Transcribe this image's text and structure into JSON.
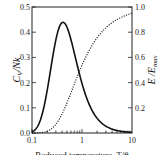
{
  "chart_data": {
    "type": "line",
    "title": "",
    "xlabel": "Reduced temperature, T/θ",
    "ylabel": "C_V / Nk",
    "ylabel_right": "E / E_max",
    "xscale": "log",
    "xlim": [
      0.1,
      10
    ],
    "ylim": [
      0,
      0.5
    ],
    "ylim_right": [
      0,
      1.0
    ],
    "x_ticks": [
      "0.1",
      "1",
      "10"
    ],
    "y_ticks": [
      "0.0",
      "0.1",
      "0.2",
      "0.3",
      "0.4",
      "0.5"
    ],
    "y_ticks_right": [
      "0.2",
      "0.4",
      "0.6",
      "0.8",
      "1.0"
    ],
    "grid": false,
    "legend": null,
    "x": [
      0.1,
      0.15,
      0.2,
      0.25,
      0.3,
      0.4,
      0.5,
      0.6,
      0.8,
      1,
      1.5,
      2,
      3,
      5,
      10
    ],
    "series": [
      {
        "name": "C_V/Nk",
        "axis": "left",
        "style": "solid",
        "values": [
          0.005,
          0.056,
          0.166,
          0.283,
          0.37,
          0.438,
          0.42,
          0.371,
          0.27,
          0.197,
          0.1,
          0.059,
          0.027,
          0.01,
          0.0025
        ]
      },
      {
        "name": "E/E_max",
        "axis": "right",
        "style": "dotted",
        "values": [
          0.0001,
          0.0025,
          0.013,
          0.036,
          0.069,
          0.151,
          0.238,
          0.318,
          0.446,
          0.538,
          0.678,
          0.755,
          0.835,
          0.9,
          0.95
        ]
      }
    ]
  },
  "labels": {
    "y_left": "C",
    "y_left_sub": "V",
    "y_left_rest": "/Nk",
    "y_right": "E /E",
    "y_right_sub": "max",
    "x": "Reduced temperature, T/θ"
  },
  "colors": {
    "line": "#111111",
    "axis": "#222222"
  }
}
